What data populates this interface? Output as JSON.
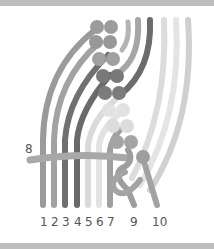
{
  "diagram": {
    "type": "macrame-knot-instruction",
    "cord_labels": {
      "c1": "1",
      "c2": "2",
      "c3": "3",
      "c4": "4",
      "c5": "5",
      "c6": "6",
      "c7": "7",
      "c8": "8",
      "c9": "9",
      "c10": "10"
    },
    "colors": {
      "band": "#bdbdbd",
      "cord_mid": "#9a9a9a",
      "cord_dark": "#6e6e6e",
      "cord_light": "#d6d6d6",
      "cord_pale": "#e6e6e6",
      "knot_mid": "#9c9c9c",
      "knot_dark": "#7a7a7a",
      "knot_light": "#dedede",
      "label": "#555555"
    }
  }
}
